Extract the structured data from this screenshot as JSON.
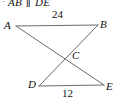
{
  "given": {
    "bullet": "·",
    "segment1": "AB",
    "parallel_symbol": "∥",
    "segment2": "DE",
    "full_text": "· AB ∥ DE"
  },
  "figure": {
    "type": "two-triangles-vertical-angles",
    "stroke_color": "#6b6b6b",
    "label_color": "#111111",
    "background": "#ffffff",
    "vertices": [
      {
        "name": "A",
        "label": "A",
        "x": 16,
        "y": 26
      },
      {
        "name": "B",
        "label": "B",
        "x": 98,
        "y": 25
      },
      {
        "name": "C",
        "label": "C",
        "x": 68,
        "y": 56
      },
      {
        "name": "D",
        "label": "D",
        "x": 39,
        "y": 86
      },
      {
        "name": "E",
        "label": "E",
        "x": 104,
        "y": 85
      }
    ],
    "segments": [
      {
        "name": "AB",
        "from": "A",
        "to": "B"
      },
      {
        "name": "DE",
        "from": "D",
        "to": "E"
      },
      {
        "name": "AE",
        "from": "A",
        "to": "E"
      },
      {
        "name": "BD",
        "from": "B",
        "to": "D"
      }
    ],
    "measures": [
      {
        "name": "AB-length",
        "segment": "AB",
        "value": "24"
      },
      {
        "name": "DE-length",
        "segment": "DE",
        "value": "12"
      }
    ]
  }
}
